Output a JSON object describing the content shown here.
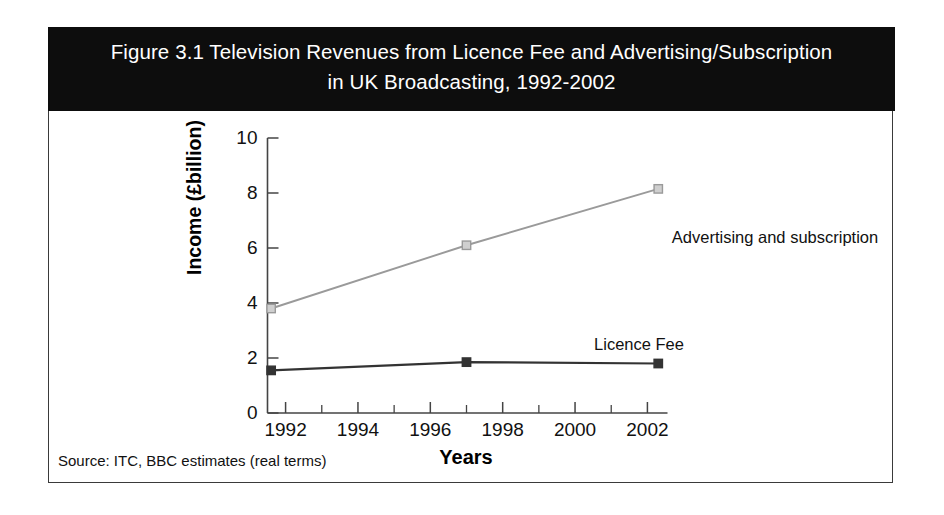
{
  "figure": {
    "title_line1": "Figure 3.1 Television Revenues from Licence Fee and Advertising/Subscription",
    "title_line2": "in UK Broadcasting, 1992-2002",
    "source_note": "Source: ITC, BBC estimates (real terms)",
    "banner_color": "#0d0d0d",
    "frame_color": "#3a3a3a"
  },
  "chart_data": {
    "type": "line",
    "title": "Figure 3.1 Television Revenues from Licence Fee and Advertising/Subscription in UK Broadcasting, 1992-2002",
    "xlabel": "Years",
    "ylabel": "Income (£billion)",
    "xlim": [
      1991.5,
      2002.5
    ],
    "ylim": [
      0,
      10
    ],
    "grid": false,
    "legend": "inline-annotations",
    "x_major_ticks": [
      1992,
      1994,
      1996,
      1998,
      2000,
      2002
    ],
    "x_minor_ticks": [
      1993,
      1995,
      1997,
      1999,
      2001
    ],
    "x_tick_labels": [
      "1992",
      "1994",
      "1996",
      "1998",
      "2000",
      "2002"
    ],
    "y_ticks": [
      0,
      2,
      4,
      6,
      8,
      10
    ],
    "y_tick_labels": [
      "0",
      "2",
      "4",
      "6",
      "8",
      "10"
    ],
    "series": [
      {
        "name": "Advertising and subscription",
        "color": "#9a9a9a",
        "marker": "square-open",
        "x": [
          1991.6,
          1997.0,
          2002.3
        ],
        "values": [
          3.8,
          6.1,
          8.15
        ]
      },
      {
        "name": "Licence Fee",
        "color": "#333333",
        "marker": "square-filled",
        "x": [
          1991.6,
          1997.0,
          2002.3
        ],
        "values": [
          1.55,
          1.85,
          1.8
        ]
      }
    ],
    "annotations": [
      {
        "text": "Advertising and subscription",
        "series": "Advertising and subscription"
      },
      {
        "text": "Licence Fee",
        "series": "Licence Fee"
      }
    ]
  },
  "axis": {
    "y_title": "Income (£billion)",
    "x_title": "Years"
  }
}
